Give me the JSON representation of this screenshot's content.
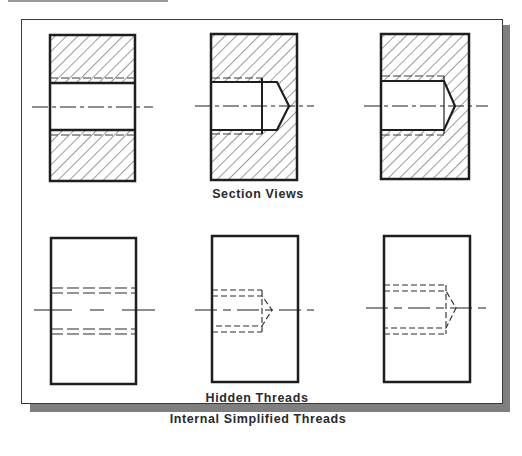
{
  "figure": {
    "title": "Internal Simplified Threads",
    "section_label": "Section Views",
    "hidden_label": "Hidden Threads",
    "colors": {
      "line": "#1e1e1e",
      "hatch": "#3a3a3a",
      "shadow": "#7f7f7f",
      "background": "#ffffff"
    },
    "rows": [
      {
        "name": "section-views",
        "views": [
          {
            "type": "through-hole",
            "style": "section"
          },
          {
            "type": "blind-hole-with-thread-end",
            "style": "section"
          },
          {
            "type": "blind-hole",
            "style": "section"
          }
        ]
      },
      {
        "name": "hidden-threads",
        "views": [
          {
            "type": "through-hole",
            "style": "hidden"
          },
          {
            "type": "blind-hole-with-thread-end",
            "style": "hidden"
          },
          {
            "type": "blind-hole",
            "style": "hidden"
          }
        ]
      }
    ]
  }
}
